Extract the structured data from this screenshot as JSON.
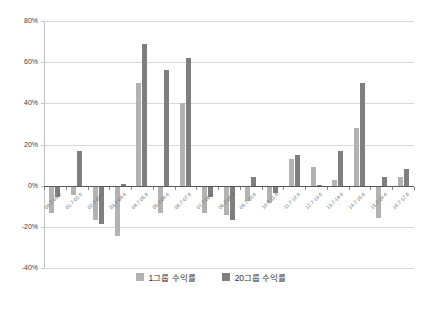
{
  "chart_data": {
    "type": "bar",
    "title": "",
    "categories": [
      "00.7-01.6",
      "01.7-02.6",
      "02.7-03.6",
      "03.7-04.6",
      "04.7-05.6",
      "05.7-06.6",
      "06.7-07.6",
      "07.7-08.6",
      "08.7-09.6",
      "09.7-10.6",
      "10.7-11.6",
      "11.7-12.6",
      "12.7-13.6",
      "13.7-14.6",
      "14.7-15.6",
      "15.7-16.6",
      "16.7-17.6"
    ],
    "series": [
      {
        "name": "1그룹 수익률",
        "color": "#b3b3b3",
        "values": [
          -13,
          -4,
          -16,
          -24,
          50,
          -13,
          40,
          -13,
          -14,
          -7,
          -8,
          13,
          9,
          3,
          28,
          -15,
          4
        ]
      },
      {
        "name": "20그룹 수익률",
        "color": "#7f7f7f",
        "values": [
          -5,
          17,
          -18,
          1,
          69,
          56,
          62,
          -5,
          -16,
          4,
          -3,
          15,
          0.5,
          17,
          50,
          4,
          8
        ]
      }
    ],
    "xlabel": "",
    "ylabel": "",
    "ylim": [
      -40,
      80
    ],
    "ytick_step": 20,
    "ytick_labels": [
      "80%",
      "60%",
      "40%",
      "20%",
      "0%",
      "-20%",
      "-40%"
    ],
    "grid": "horizontal",
    "legend_position": "bottom",
    "colors": {
      "gridline": "#d9d9d9",
      "zero_axis": "#595959",
      "axis_line": "#c3c3c3",
      "y_label": "#404040",
      "x_label": "#6b6b6b",
      "legend_text": "#333333",
      "background": "#ffffff"
    }
  }
}
